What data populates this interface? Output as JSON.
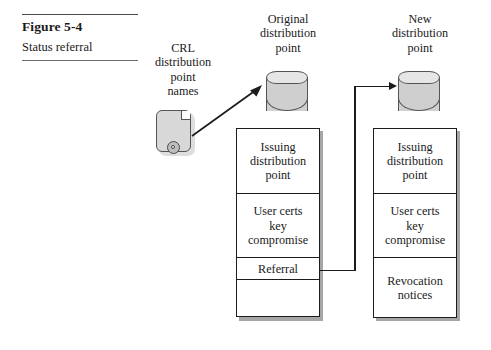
{
  "figure": {
    "number": "Figure 5-4",
    "title": "Status referral"
  },
  "nodes": {
    "crl_scroll": {
      "label": "CRL\ndistribution\npoint\nnames",
      "icon": "scroll-with-seal"
    },
    "original_point": {
      "label": "Original\ndistribution\npoint",
      "icon": "cylinder-database"
    },
    "new_point": {
      "label": "New\ndistribution\npoint",
      "icon": "cylinder-database"
    }
  },
  "tables": {
    "original_crl": {
      "name": "Original CRL",
      "cells": [
        {
          "text": "Issuing\ndistribution\npoint",
          "height": 66
        },
        {
          "text": "User certs\nkey\ncompromise",
          "height": 66
        },
        {
          "text": "Referral",
          "height": 23
        },
        {
          "text": "",
          "height": 38
        }
      ]
    },
    "new_crl": {
      "name": "New CRL",
      "cells": [
        {
          "text": "Issuing\ndistribution\npoint",
          "height": 66
        },
        {
          "text": "User certs\nkey\ncompromise",
          "height": 66
        },
        {
          "text": "Revocation\nnotices",
          "height": 61
        }
      ]
    }
  },
  "connectors": [
    {
      "name": "names-to-original",
      "from": "crl-scroll",
      "to": "original-distribution-point",
      "style": "diagonal-arrow"
    },
    {
      "name": "referral-to-new",
      "from": "referral-cell",
      "to": "new-distribution-point",
      "style": "elbow-arrow"
    }
  ],
  "colors": {
    "ink": "#1a1a1a",
    "rule": "#4a4a4a",
    "cylinder_fill": "#cfcfcf",
    "cylinder_top": "#e6e6e6",
    "scroll_fill": "#d8d8d8",
    "cell_border": "#1c1c1c",
    "page_background": "#ffffff"
  }
}
